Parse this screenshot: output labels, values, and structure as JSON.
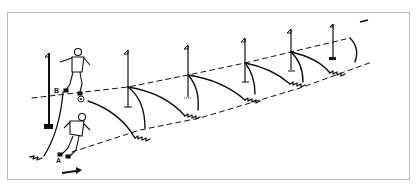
{
  "figure": {
    "stroke_color": "#111111",
    "border_color": "#b8b8b8",
    "background": "#ffffff"
  },
  "players": [
    {
      "id": "player-b",
      "label": "B",
      "role": "kicking ball from top line"
    },
    {
      "id": "player-a",
      "label": "A",
      "role": "running from bottom line"
    }
  ],
  "ball": {
    "name": "soccer-ball"
  },
  "poles": [
    {
      "x": 49,
      "top": 53,
      "base": 128
    },
    {
      "x": 128,
      "top": 47,
      "base": 107
    },
    {
      "x": 188,
      "top": 43,
      "base": 97
    },
    {
      "x": 245,
      "top": 37,
      "base": 82
    },
    {
      "x": 291,
      "top": 28,
      "base": 70
    },
    {
      "x": 332,
      "top": 24,
      "base": 60
    }
  ],
  "arrows": {
    "start_arrow": "direction-right",
    "end_arrow": "direction-left"
  }
}
